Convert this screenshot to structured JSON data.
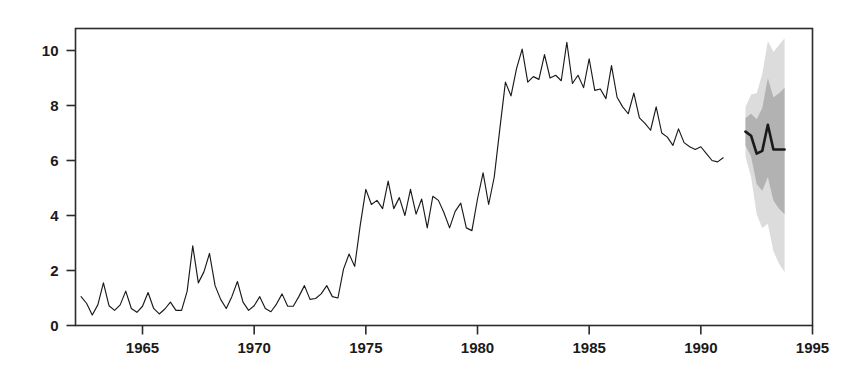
{
  "chart_data": {
    "type": "line",
    "title": "",
    "subtitle": "",
    "xlabel": "",
    "ylabel": "",
    "xlim": [
      1962.0,
      1995.0
    ],
    "ylim": [
      0,
      10.8
    ],
    "grid": false,
    "legend_position": "none",
    "annotations": [],
    "x_ticks": [
      1965,
      1970,
      1975,
      1980,
      1985,
      1990,
      1995
    ],
    "x_tick_labels": [
      "1965",
      "1970",
      "1975",
      "1980",
      "1985",
      "1990",
      "1995"
    ],
    "y_ticks": [
      0,
      2,
      4,
      6,
      8,
      10
    ],
    "y_tick_labels": [
      "0",
      "2",
      "4",
      "6",
      "8",
      "10"
    ],
    "series": [
      {
        "name": "observed",
        "kind": "line",
        "color": "#1a1a1a",
        "x_start": 1962.25,
        "x_step": 0.25,
        "values": [
          1.05,
          0.8,
          0.38,
          0.75,
          1.55,
          0.72,
          0.55,
          0.75,
          1.25,
          0.62,
          0.48,
          0.7,
          1.2,
          0.62,
          0.42,
          0.6,
          0.85,
          0.55,
          0.55,
          1.25,
          2.9,
          1.55,
          1.95,
          2.62,
          1.45,
          0.95,
          0.62,
          1.05,
          1.6,
          0.85,
          0.55,
          0.72,
          1.05,
          0.62,
          0.5,
          0.78,
          1.15,
          0.7,
          0.7,
          1.05,
          1.45,
          0.95,
          0.98,
          1.15,
          1.45,
          1.05,
          1.0,
          2.05,
          2.6,
          2.15,
          3.65,
          4.95,
          4.4,
          4.55,
          4.25,
          5.25,
          4.25,
          4.65,
          4.0,
          4.95,
          4.05,
          4.6,
          3.55,
          4.7,
          4.55,
          4.1,
          3.55,
          4.15,
          4.45,
          3.55,
          3.45,
          4.6,
          5.55,
          4.4,
          5.4,
          7.15,
          8.85,
          8.35,
          9.35,
          10.05,
          8.85,
          9.05,
          8.95,
          9.85,
          9.0,
          9.1,
          8.9,
          10.3,
          8.8,
          9.1,
          8.65,
          9.7,
          8.55,
          8.6,
          8.25,
          9.45,
          8.3,
          7.95,
          7.7,
          8.45,
          7.55,
          7.35,
          7.1,
          7.95,
          7.0,
          6.85,
          6.55,
          7.15,
          6.65,
          6.5,
          6.4,
          6.5,
          6.25,
          6.0,
          5.95,
          6.1
        ]
      },
      {
        "name": "forecast",
        "kind": "line",
        "color": "#1a1a1a",
        "x_start": 1992.0,
        "x_step": 0.25,
        "values": [
          7.05,
          6.9,
          6.25,
          6.35,
          7.3,
          6.4,
          6.4,
          6.4
        ]
      }
    ],
    "intervals": [
      {
        "name": "outer-prediction-interval",
        "color": "#dcdcdc",
        "x_start": 1992.0,
        "x_step": 0.25,
        "lower": [
          6.15,
          5.4,
          4.05,
          3.55,
          3.7,
          2.7,
          2.25,
          1.95
        ],
        "upper": [
          7.95,
          8.4,
          8.45,
          9.15,
          10.35,
          9.95,
          10.2,
          10.45
        ]
      },
      {
        "name": "inner-prediction-interval",
        "color": "#b2b2b2",
        "x_start": 1992.0,
        "x_step": 0.25,
        "lower": [
          6.55,
          6.15,
          5.15,
          4.9,
          5.4,
          4.55,
          4.25,
          4.05
        ],
        "upper": [
          7.55,
          7.7,
          7.5,
          7.9,
          9.0,
          8.3,
          8.45,
          8.65
        ]
      }
    ]
  },
  "axes": {
    "line_color": "#2b2b2b",
    "tick_color": "#2b2b2b",
    "frame": "box"
  }
}
